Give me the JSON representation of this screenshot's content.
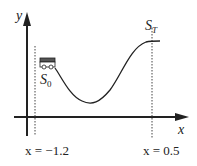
{
  "diagram": {
    "type": "mountain-car-sketch",
    "axes": {
      "x_label": "x",
      "y_label": "y"
    },
    "states": {
      "start_label": "S",
      "start_sub": "0",
      "terminal_label": "S",
      "terminal_sub": "T"
    },
    "boundaries": {
      "left_label": "x = −1.2",
      "right_label": "x = 0.5"
    },
    "colors": {
      "ink": "#222222",
      "background": "#ffffff"
    }
  }
}
